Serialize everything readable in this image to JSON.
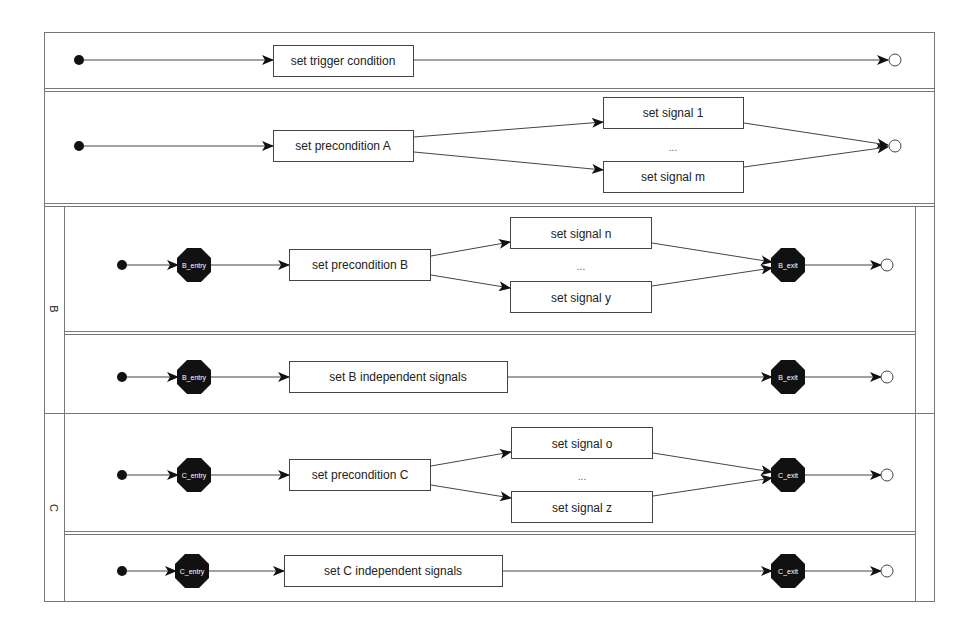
{
  "diagram": {
    "type": "activity-diagram",
    "colors": {
      "line": "#444444",
      "frame": "#777777",
      "node_fill": "#111111",
      "box_fill": "#ffffff",
      "final_fill": "#ffffff"
    },
    "rows": [
      {
        "id": "trigger",
        "action": "set trigger condition"
      },
      {
        "id": "precondition-a",
        "action": "set precondition A",
        "signals": [
          "set signal 1",
          "set signal m"
        ],
        "ellipsis": "..."
      },
      {
        "id": "b-dependent",
        "lane": "B",
        "entry": "B_entry",
        "action": "set precondition B",
        "signals": [
          "set signal n",
          "set signal y"
        ],
        "ellipsis": "...",
        "exit": "B_exit"
      },
      {
        "id": "b-independent",
        "lane": "B",
        "entry": "B_entry",
        "action": "set B independent signals",
        "exit": "B_exit"
      },
      {
        "id": "c-dependent",
        "lane": "C",
        "entry": "C_entry",
        "action": "set precondition C",
        "signals": [
          "set signal o",
          "set signal z"
        ],
        "ellipsis": "...",
        "exit": "C_exit"
      },
      {
        "id": "c-independent",
        "lane": "C",
        "entry": "C_entry",
        "action": "set C independent signals",
        "exit": "C_exit"
      }
    ],
    "lanes": [
      {
        "label": "B"
      },
      {
        "label": "C"
      }
    ]
  }
}
